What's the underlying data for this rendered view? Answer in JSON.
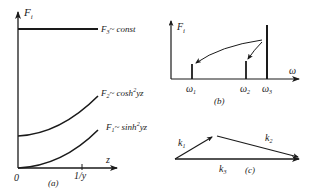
{
  "panel_a": {
    "caption": "(a)",
    "y_axis_label": "F",
    "y_axis_sub": "i",
    "x_axis_label": "z",
    "origin_label": "0",
    "tick_label": "1/y",
    "curves": [
      {
        "name": "F3",
        "base": "F",
        "sub": "3",
        "relation": "~ const"
      },
      {
        "name": "F2",
        "base": "F",
        "sub": "2",
        "relation": "~ cosh",
        "sup": "2",
        "arg": "yz"
      },
      {
        "name": "F1",
        "base": "F",
        "sub": "1",
        "relation": "~ sinh",
        "sup": "2",
        "arg": "yz"
      }
    ]
  },
  "panel_b": {
    "caption": "(b)",
    "y_axis_label": "F",
    "y_axis_sub": "i",
    "x_axis_label": "ω",
    "bars": [
      {
        "label": "ω",
        "sub": "1"
      },
      {
        "label": "ω",
        "sub": "2"
      },
      {
        "label": "ω",
        "sub": "3"
      }
    ]
  },
  "panel_c": {
    "caption": "(c)",
    "vectors": [
      {
        "label": "k",
        "sub": "1"
      },
      {
        "label": "k",
        "sub": "2"
      },
      {
        "label": "k",
        "sub": "3"
      }
    ]
  }
}
